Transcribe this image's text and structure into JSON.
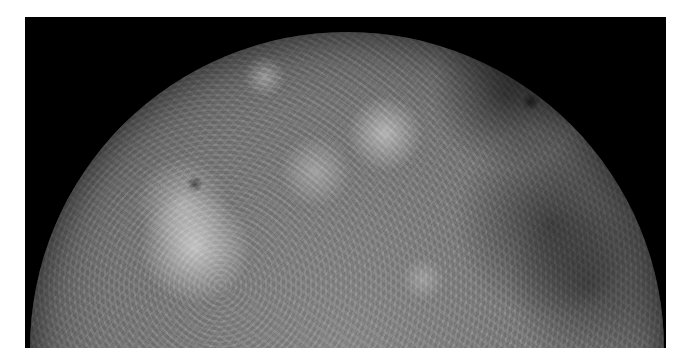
{
  "image": {
    "subject": "planetary-body-limb",
    "description": "Grayscale photograph of the upper half of a cratered planetary body against black space",
    "colors": {
      "page_background": "#ffffff",
      "space_background": "#000000",
      "surface_mid_gray": "#7a7a7a",
      "surface_highlight": "#d8d8d8",
      "surface_dark": "#3e3e3e"
    }
  }
}
